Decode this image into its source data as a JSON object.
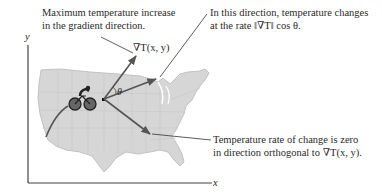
{
  "diagram": {
    "annotations": {
      "max_increase": {
        "line1": "Maximum temperature increase",
        "line2": "in the gradient direction."
      },
      "direction_rate": {
        "line1": "In this direction, temperature changes",
        "line2": "at the rate ‖∇T‖ cos θ."
      },
      "zero_rate": {
        "line1": "Temperature rate of change is zero",
        "line2": "in direction orthogonal to ∇T(x, y)."
      }
    },
    "vector_label": "∇T(x, y)",
    "angle_label": "θ",
    "axes": {
      "x_label": "x",
      "y_label": "y"
    },
    "icons": [
      "bicycle-rider-icon",
      "us-map"
    ],
    "colors": {
      "map_fill": "#d6d6d6",
      "map_border": "#bdbdbd",
      "arrow": "#555555",
      "axis": "#444444",
      "leader_line": "#333333",
      "text": "#2a2a2a"
    }
  }
}
